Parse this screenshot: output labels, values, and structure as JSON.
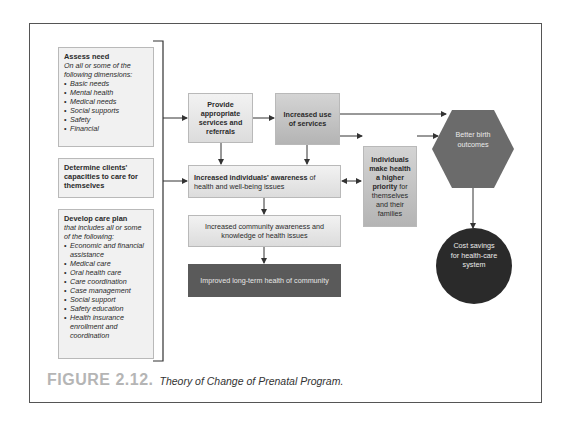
{
  "diagram": {
    "left_boxes": {
      "assess": {
        "title": "Assess need",
        "subtitle": "On all or some of the following dimensions:",
        "items": [
          "Basic needs",
          "Mental health",
          "Medical needs",
          "Social supports",
          "Safety",
          "Financial"
        ]
      },
      "determine": {
        "title": "Determine clients' capacities to care for themselves"
      },
      "develop": {
        "title": "Develop care plan",
        "subtitle": "that includes all or some of the following:",
        "items": [
          "Economic and financial assistance",
          "Medical care",
          "Oral health care",
          "Care coordination",
          "Case management",
          "Social support",
          "Safety education",
          "Health insurance enrollment and coordination"
        ]
      }
    },
    "nodes": {
      "provide": "Provide appropriate services and referrals",
      "increased_use": "Increased use of services",
      "awareness_bold": "Increased individuals' awareness",
      "awareness_rest": " of health and well-being issues",
      "priority_bold": "Individuals make health a higher priority",
      "priority_rest": " for themselves and their families",
      "community": "Increased community awareness and knowledge of health issues",
      "longterm": "Improved long-term health of community",
      "birth": "Better birth outcomes",
      "cost": "Cost savings for health-care system"
    },
    "colors": {
      "light_box": "#e8e8e8",
      "mid_box": "#c4c4c4",
      "dark_box": "#5a5a5a",
      "hexagon": "#6b6b6b",
      "circle": "#2a2a2a"
    }
  },
  "caption": {
    "number": "FIGURE 2.12.",
    "text": "Theory of Change of Prenatal Program."
  }
}
